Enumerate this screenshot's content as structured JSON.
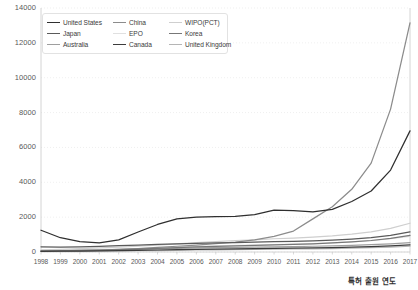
{
  "chart": {
    "type": "line",
    "title": "",
    "xlabel": "특허 출원 연도",
    "ylabel": ""
  },
  "axes": {
    "y_ticks": [
      "0",
      "2000",
      "4000",
      "6000",
      "8000",
      "10000",
      "12000",
      "14000"
    ],
    "y_min": 0,
    "y_max": 14000,
    "x_ticks": [
      "1998",
      "1999",
      "2000",
      "2001",
      "2002",
      "2003",
      "2004",
      "2005",
      "2006",
      "2007",
      "2008",
      "2009",
      "2010",
      "2011",
      "2012",
      "2013",
      "2014",
      "2015",
      "2016",
      "2017"
    ],
    "grid": "horizontal-dotted",
    "legend_position": "top-left"
  },
  "legend": {
    "items": [
      {
        "label": "United States",
        "color": "#2f2f2f"
      },
      {
        "label": "China",
        "color": "#8c8c8c"
      },
      {
        "label": "WIPO(PCT)",
        "color": "#cfcfcf"
      },
      {
        "label": "Japan",
        "color": "#5a5a5a"
      },
      {
        "label": "EPO",
        "color": "#e0e0e0"
      },
      {
        "label": "Korea",
        "color": "#777777"
      },
      {
        "label": "Australia",
        "color": "#9e9e9e"
      },
      {
        "label": "Canada",
        "color": "#3c3c3c"
      },
      {
        "label": "United Kingdom",
        "color": "#b5b5b5"
      }
    ]
  },
  "chart_data": {
    "type": "line",
    "title": "",
    "xlabel": "특허 출원 연도",
    "ylabel": "",
    "ylim": [
      0,
      14000
    ],
    "grid": true,
    "legend_position": "top-left",
    "x": [
      1998,
      1999,
      2000,
      2001,
      2002,
      2003,
      2004,
      2005,
      2006,
      2007,
      2008,
      2009,
      2010,
      2011,
      2012,
      2013,
      2014,
      2015,
      2016,
      2017
    ],
    "categories": [
      "1998",
      "1999",
      "2000",
      "2001",
      "2002",
      "2003",
      "2004",
      "2005",
      "2006",
      "2007",
      "2008",
      "2009",
      "2010",
      "2011",
      "2012",
      "2013",
      "2014",
      "2015",
      "2016",
      "2017"
    ],
    "series": [
      {
        "name": "United States",
        "color": "#2f2f2f",
        "values": [
          1250,
          820,
          600,
          520,
          700,
          1150,
          1580,
          1900,
          2000,
          2030,
          2050,
          2150,
          2400,
          2380,
          2300,
          2450,
          2900,
          3500,
          4700,
          6950
        ]
      },
      {
        "name": "China",
        "color": "#8c8c8c",
        "values": [
          60,
          70,
          90,
          110,
          150,
          200,
          260,
          330,
          400,
          480,
          560,
          700,
          900,
          1200,
          1900,
          2600,
          3600,
          5100,
          8200,
          13150
        ]
      },
      {
        "name": "WIPO(PCT)",
        "color": "#cfcfcf",
        "values": [
          120,
          150,
          200,
          230,
          280,
          330,
          400,
          470,
          540,
          600,
          660,
          700,
          760,
          800,
          850,
          920,
          1020,
          1150,
          1350,
          1650
        ]
      },
      {
        "name": "Japan",
        "color": "#5a5a5a",
        "values": [
          300,
          280,
          300,
          320,
          360,
          400,
          440,
          470,
          500,
          520,
          540,
          560,
          590,
          610,
          640,
          680,
          740,
          820,
          950,
          1150
        ]
      },
      {
        "name": "EPO",
        "color": "#e0e0e0",
        "values": [
          90,
          100,
          120,
          140,
          170,
          200,
          240,
          280,
          320,
          350,
          380,
          400,
          430,
          450,
          480,
          520,
          580,
          650,
          760,
          900
        ]
      },
      {
        "name": "Korea",
        "color": "#777777",
        "values": [
          50,
          60,
          80,
          100,
          130,
          170,
          210,
          250,
          290,
          320,
          350,
          380,
          410,
          440,
          470,
          520,
          580,
          660,
          780,
          950
        ]
      },
      {
        "name": "Australia",
        "color": "#9e9e9e",
        "values": [
          70,
          80,
          95,
          110,
          130,
          155,
          180,
          205,
          230,
          250,
          270,
          285,
          300,
          315,
          330,
          350,
          380,
          420,
          470,
          540
        ]
      },
      {
        "name": "Canada",
        "color": "#3c3c3c",
        "values": [
          40,
          45,
          55,
          65,
          80,
          95,
          115,
          135,
          155,
          170,
          185,
          195,
          210,
          220,
          235,
          250,
          275,
          305,
          350,
          410
        ]
      },
      {
        "name": "United Kingdom",
        "color": "#b5b5b5",
        "values": [
          30,
          35,
          42,
          50,
          60,
          72,
          85,
          100,
          115,
          128,
          140,
          150,
          162,
          172,
          185,
          200,
          220,
          245,
          280,
          330
        ]
      }
    ]
  }
}
